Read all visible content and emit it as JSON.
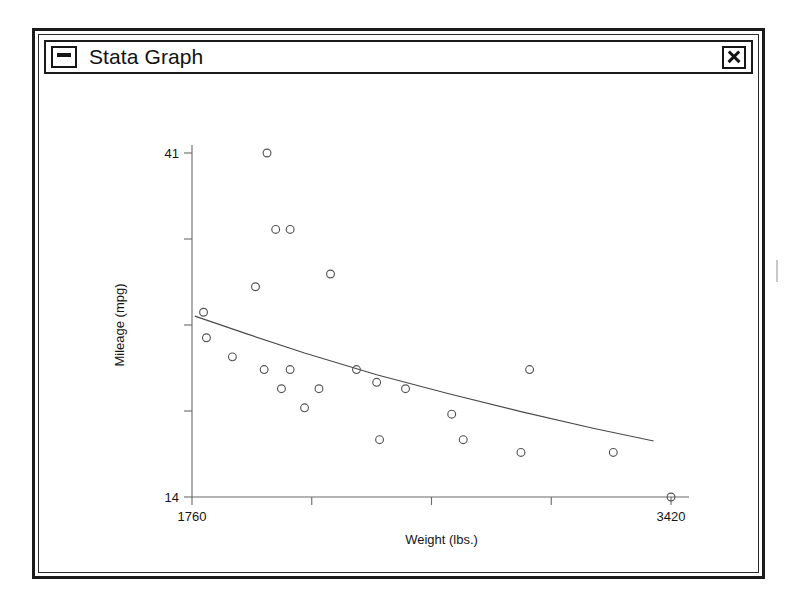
{
  "window": {
    "title": "Stata Graph",
    "system_menu_icon": "minimize-box-icon",
    "close_icon": "close-x-icon"
  },
  "chart_data": {
    "type": "scatter",
    "title": "",
    "xlabel": "Weight (lbs.)",
    "ylabel": "Mileage (mpg)",
    "xlim": [
      1760,
      3420
    ],
    "ylim": [
      14,
      41
    ],
    "x_tick_labels": [
      "1760",
      "3420"
    ],
    "y_tick_labels": [
      "41",
      "14"
    ],
    "x_tick_count": 5,
    "y_tick_count": 5,
    "grid": false,
    "legend": "none",
    "marker": "open-circle",
    "series": [
      {
        "name": "Mileage vs Weight",
        "points": [
          [
            2020,
            41.0
          ],
          [
            2050,
            35.0
          ],
          [
            2100,
            35.0
          ],
          [
            1800,
            28.5
          ],
          [
            1980,
            30.5
          ],
          [
            2240,
            31.5
          ],
          [
            1810,
            26.5
          ],
          [
            1900,
            25.0
          ],
          [
            2010,
            24.0
          ],
          [
            2100,
            24.0
          ],
          [
            2070,
            22.5
          ],
          [
            2200,
            22.5
          ],
          [
            2150,
            21.0
          ],
          [
            2330,
            24.0
          ],
          [
            2400,
            23.0
          ],
          [
            2500,
            22.5
          ],
          [
            2410,
            18.5
          ],
          [
            2930,
            24.0
          ],
          [
            2700,
            18.5
          ],
          [
            2660,
            20.5
          ],
          [
            2900,
            17.5
          ],
          [
            3220,
            17.5
          ],
          [
            3420,
            14.0
          ]
        ]
      }
    ],
    "fit": {
      "name": "fitted-curve",
      "type": "curve",
      "points": [
        [
          1770,
          28.2
        ],
        [
          1950,
          26.8
        ],
        [
          2150,
          25.3
        ],
        [
          2400,
          23.6
        ],
        [
          2650,
          22.1
        ],
        [
          2900,
          20.7
        ],
        [
          3150,
          19.4
        ],
        [
          3360,
          18.4
        ]
      ]
    }
  }
}
